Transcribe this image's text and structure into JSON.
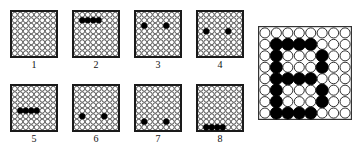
{
  "meta": {
    "grid_size": 8,
    "background_color": "#ffffff",
    "line_color": "#1a1a1a",
    "fill_color": "#000000"
  },
  "frames": [
    {
      "label": "1",
      "filled": []
    },
    {
      "label": "2",
      "filled": [
        [
          1,
          1
        ],
        [
          1,
          2
        ],
        [
          1,
          3
        ],
        [
          1,
          4
        ]
      ]
    },
    {
      "label": "3",
      "filled": [
        [
          2,
          1
        ],
        [
          2,
          5
        ]
      ]
    },
    {
      "label": "4",
      "filled": [
        [
          3,
          1
        ],
        [
          3,
          5
        ]
      ]
    },
    {
      "label": "5",
      "filled": [
        [
          4,
          1
        ],
        [
          4,
          2
        ],
        [
          4,
          3
        ],
        [
          4,
          4
        ]
      ]
    },
    {
      "label": "6",
      "filled": [
        [
          5,
          1
        ],
        [
          5,
          5
        ]
      ]
    },
    {
      "label": "7",
      "filled": [
        [
          6,
          1
        ],
        [
          6,
          5
        ]
      ]
    },
    {
      "label": "8",
      "filled": [
        [
          7,
          1
        ],
        [
          7,
          2
        ],
        [
          7,
          3
        ],
        [
          7,
          4
        ]
      ]
    }
  ],
  "result_grid": {
    "letter": "B",
    "filled": [
      [
        1,
        1
      ],
      [
        1,
        2
      ],
      [
        1,
        3
      ],
      [
        1,
        4
      ],
      [
        2,
        1
      ],
      [
        2,
        5
      ],
      [
        3,
        1
      ],
      [
        3,
        5
      ],
      [
        4,
        1
      ],
      [
        4,
        2
      ],
      [
        4,
        3
      ],
      [
        4,
        4
      ],
      [
        5,
        1
      ],
      [
        5,
        5
      ],
      [
        6,
        1
      ],
      [
        6,
        5
      ],
      [
        7,
        1
      ],
      [
        7,
        2
      ],
      [
        7,
        3
      ],
      [
        7,
        4
      ]
    ]
  }
}
